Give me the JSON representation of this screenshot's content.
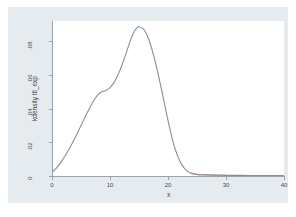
{
  "chart_data": {
    "type": "line",
    "title": "",
    "subtitle": "",
    "xlabel": "x",
    "ylabel": "kdensity ttl_exp",
    "xlim": [
      0,
      40
    ],
    "ylim": [
      0,
      0.092
    ],
    "grid": false,
    "legend": null,
    "xticks": [
      0,
      10,
      20,
      30,
      40
    ],
    "xtick_labels": [
      "0",
      "10",
      "20",
      "30",
      "40"
    ],
    "yticks": [
      0,
      0.02,
      0.04,
      0.06,
      0.08
    ],
    "ytick_labels": [
      "0",
      ".02",
      ".04",
      ".06",
      ".08"
    ],
    "series": [
      {
        "name": "kdensity ttl_exp",
        "color": "#8a8f96",
        "x": [
          0,
          0.8,
          1.6,
          2.4,
          3.2,
          4.0,
          4.8,
          5.6,
          6.4,
          7.2,
          8.0,
          8.6,
          9.2,
          10.0,
          10.8,
          11.6,
          12.4,
          13.2,
          14.0,
          14.8,
          15.4,
          16.0,
          16.8,
          17.6,
          18.4,
          19.2,
          20.0,
          20.8,
          21.6,
          22.4,
          23.2,
          24.0,
          25.0,
          26.0,
          28.0,
          30.0,
          32.0,
          34.0,
          36.0,
          38.0,
          40.0
        ],
        "y": [
          0.0022,
          0.0048,
          0.0085,
          0.0128,
          0.0175,
          0.0228,
          0.0285,
          0.0342,
          0.0398,
          0.0448,
          0.0486,
          0.05,
          0.0506,
          0.0524,
          0.056,
          0.0618,
          0.069,
          0.0772,
          0.0846,
          0.0884,
          0.088,
          0.0862,
          0.08,
          0.0706,
          0.059,
          0.0462,
          0.033,
          0.0212,
          0.0124,
          0.0066,
          0.0032,
          0.0016,
          0.0009,
          0.0007,
          0.0005,
          0.0004,
          0.0004,
          0.0003,
          0.0003,
          0.0003,
          0.0003
        ]
      },
      {
        "name": "tail-segment",
        "color": "#d9a3ad",
        "x": [
          24.0,
          25.0,
          26.0,
          27.0,
          28.0,
          29.0,
          30.0
        ],
        "y": [
          0.0016,
          0.0009,
          0.0007,
          0.0006,
          0.0005,
          0.0005,
          0.0004
        ]
      }
    ]
  },
  "axes": {
    "y_title": "kdensity ttl_exp",
    "x_title": "x",
    "y_tick_labels": [
      "0",
      ".02",
      ".04",
      ".06",
      ".08"
    ],
    "x_tick_labels": [
      "0",
      "10",
      "20",
      "30",
      "40"
    ]
  },
  "colors": {
    "curve": "#8a8f96",
    "tail_accent": "#d9a3ad",
    "axis": "#9aa3ab",
    "graph_background": "#e6ebf0",
    "plot_background": "#ffffff",
    "page_background": "#ffffff",
    "text": "#3c3c3c"
  }
}
